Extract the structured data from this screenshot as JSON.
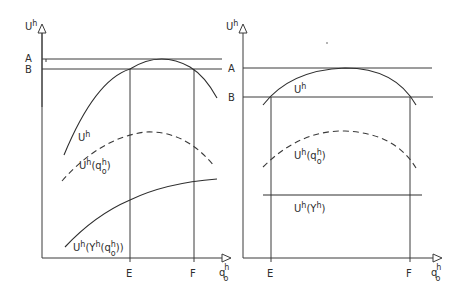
{
  "figure": {
    "left_panel": {
      "y_axis_label": "U",
      "y_axis_label_sup": "h",
      "x_axis_label": "q",
      "x_axis_label_sup": "h",
      "x_axis_label_sub": "o",
      "y_levels": [
        "A",
        "B"
      ],
      "x_ticks": [
        "E",
        "F"
      ],
      "curves": [
        {
          "name": "U",
          "sup": "h",
          "style": "solid"
        },
        {
          "name": "U",
          "sup": "h",
          "arg": "(q",
          "arg_sup": "h",
          "arg_sub": "o",
          "close": ")",
          "style": "dashed"
        },
        {
          "name": "U",
          "sup": "h",
          "arg": "(Y",
          "arg_sup": "h",
          "arg2": "(q",
          "arg2_sup": "h",
          "arg2_sub": "o",
          "close": "))",
          "style": "solid"
        }
      ]
    },
    "right_panel": {
      "y_axis_label": "U",
      "y_axis_label_sup": "h",
      "x_axis_label": "q",
      "x_axis_label_sup": "h",
      "x_axis_label_sub": "o",
      "y_levels": [
        "A",
        "B"
      ],
      "x_ticks": [
        "E",
        "F"
      ],
      "curves": [
        {
          "name": "U",
          "sup": "h",
          "style": "solid"
        },
        {
          "name": "U",
          "sup": "h",
          "arg": "(q",
          "arg_sup": "h",
          "arg_sub": "o",
          "close": ")",
          "style": "dashed"
        },
        {
          "name": "U",
          "sup": "h",
          "arg": "(Y",
          "arg_sup": "h",
          "close": ")",
          "style": "solid-horizontal"
        }
      ]
    }
  }
}
